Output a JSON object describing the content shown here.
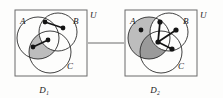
{
  "figure": {
    "type": "set-diagram-pair",
    "caption_left": "D₁",
    "caption_right": "D₂",
    "connector": "horizontal-link",
    "colors": {
      "stroke": "#2b2b2b",
      "box_stroke": "#6b6b6b",
      "shade_light": "#bdbdbd",
      "shade_dark": "#9a9a9a",
      "vertex": "#141414",
      "background": "#fdfdfc"
    }
  },
  "panels": [
    {
      "id": "D1",
      "caption": "D₁",
      "universe_label": "U",
      "set_labels": {
        "A": "A",
        "B": "B",
        "C": "C"
      },
      "circles": [
        {
          "name": "A",
          "cx": 38,
          "cy": 38,
          "r": 21
        },
        {
          "name": "B",
          "cx": 58,
          "cy": 32,
          "r": 19
        },
        {
          "name": "C",
          "cx": 50,
          "cy": 52,
          "r": 21
        }
      ],
      "shaded_region": "A ∩ C ∖ B",
      "vertices": [
        {
          "id": "v1",
          "x": 45,
          "y": 22
        },
        {
          "id": "v2",
          "x": 63,
          "y": 28
        },
        {
          "id": "v3",
          "x": 48,
          "y": 40
        },
        {
          "id": "v4",
          "x": 33,
          "y": 47
        }
      ],
      "edges": [
        {
          "from": "v1",
          "to": "v2"
        },
        {
          "from": "v3",
          "to": "v4"
        }
      ]
    },
    {
      "id": "D2",
      "caption": "D₂",
      "universe_label": "U",
      "set_labels": {
        "A": "A",
        "B": "B",
        "C": "C"
      },
      "circles": [
        {
          "name": "A",
          "cx": 149,
          "cy": 38,
          "r": 21
        },
        {
          "name": "B",
          "cx": 169,
          "cy": 32,
          "r": 19
        },
        {
          "name": "C",
          "cx": 161,
          "cy": 52,
          "r": 21
        }
      ],
      "shaded_region": "A (whole disc, darker in A ∩ C)",
      "vertices": [
        {
          "id": "w1",
          "x": 141,
          "y": 30
        },
        {
          "id": "w2",
          "x": 160,
          "y": 22
        },
        {
          "id": "w3",
          "x": 176,
          "y": 30
        },
        {
          "id": "w4",
          "x": 158,
          "y": 42
        },
        {
          "id": "w5",
          "x": 172,
          "y": 49
        }
      ],
      "edges": [
        {
          "from": "w4",
          "to": "w2"
        },
        {
          "from": "w4",
          "to": "w3"
        },
        {
          "from": "w4",
          "to": "w5"
        }
      ]
    }
  ]
}
